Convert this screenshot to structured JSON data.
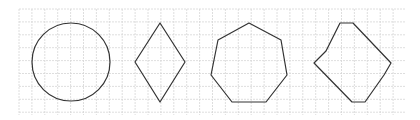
{
  "canvas": {
    "width": 420,
    "height": 120,
    "background": "#ffffff"
  },
  "grid": {
    "x0": 19,
    "y0": 9,
    "x1": 405,
    "y1": 115,
    "step": 12.9,
    "color": "#d6d6d6"
  },
  "stroke": {
    "color": "#333333",
    "width": 1.2
  },
  "shapes": [
    {
      "name": "circle",
      "type": "circle",
      "cx": 71,
      "cy": 62,
      "r": 39
    },
    {
      "name": "rhombus",
      "type": "polygon",
      "points": "160,23 185,62 160,102 135,62"
    },
    {
      "name": "heptagon",
      "type": "polygon",
      "points": "249,23 281,40 287,75 266,102 232,102 211,75 218,40"
    },
    {
      "name": "irregular-polygon",
      "type": "polygon",
      "points": "340,23 353,23 391,63 384,75 365,102 352,102 314,63 326,51"
    }
  ]
}
